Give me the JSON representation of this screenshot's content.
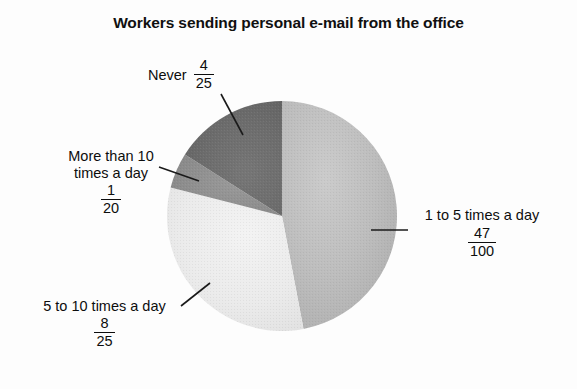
{
  "chart_data": {
    "type": "pie",
    "title": "Workers sending personal e-mail from the office",
    "xlabel": "",
    "ylabel": "",
    "legend_position": "none",
    "grid": false,
    "categories": [
      "1 to 5 times a day",
      "5 to 10 times a day",
      "More than 10 times a day",
      "Never"
    ],
    "values": [
      0.47,
      0.32,
      0.05,
      0.16
    ],
    "value_labels": [
      "47/100",
      "8/25",
      "1/20",
      "4/25"
    ],
    "fractions": [
      {
        "numerator": "47",
        "denominator": "100"
      },
      {
        "numerator": "8",
        "denominator": "25"
      },
      {
        "numerator": "1",
        "denominator": "20"
      },
      {
        "numerator": "4",
        "denominator": "25"
      }
    ],
    "slice_colors": [
      "#b9b9b9",
      "#ebebeb",
      "#8e8e8e",
      "#6c6c6c"
    ],
    "start_angle_deg": 0,
    "direction": "clockwise",
    "annotations": [
      "leader lines connect each label to its slice"
    ]
  },
  "figure": {
    "title": "Workers sending personal e-mail from the office",
    "background_color": "#fdfdfd",
    "text_color": "#0d0d0d",
    "leader_line_color": "#1a1a1a"
  },
  "labels": {
    "never": {
      "text": "Never",
      "numerator": "4",
      "denominator": "25"
    },
    "more_than_10": {
      "line1": "More than 10",
      "line2": "times a day",
      "numerator": "1",
      "denominator": "20"
    },
    "five_to_ten": {
      "line1": "5 to 10 times a day",
      "numerator": "8",
      "denominator": "25"
    },
    "one_to_five": {
      "line1": "1 to 5 times a day",
      "numerator": "47",
      "denominator": "100"
    }
  }
}
